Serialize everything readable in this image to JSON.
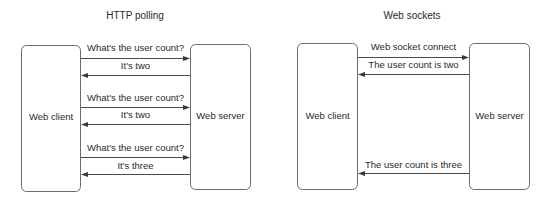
{
  "diagrams": [
    {
      "title": "HTTP polling",
      "client_label": "Web client",
      "server_label": "Web server",
      "messages": [
        {
          "text": "What's the user count?",
          "direction": "client-to-server"
        },
        {
          "text": "It's two",
          "direction": "server-to-client"
        },
        {
          "text": "What's the user count?",
          "direction": "client-to-server"
        },
        {
          "text": "It's two",
          "direction": "server-to-client"
        },
        {
          "text": "What's the user count?",
          "direction": "client-to-server"
        },
        {
          "text": "It's three",
          "direction": "server-to-client"
        }
      ]
    },
    {
      "title": "Web sockets",
      "client_label": "Web client",
      "server_label": "Web server",
      "messages": [
        {
          "text": "Web socket connect",
          "direction": "client-to-server"
        },
        {
          "text": "The user count is two",
          "direction": "server-to-client"
        },
        {
          "text": "The user count is three",
          "direction": "server-to-client"
        }
      ]
    }
  ]
}
